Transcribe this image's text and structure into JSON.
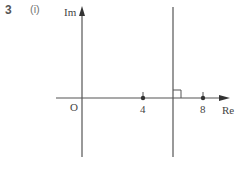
{
  "question": {
    "number": "3",
    "part": "(i)"
  },
  "diagram": {
    "axes": {
      "imaginary_label": "Im",
      "real_label": "Re",
      "origin_label": "O"
    },
    "points": [
      {
        "label": "4",
        "value": 4
      },
      {
        "label": "8",
        "value": 8
      }
    ],
    "perpendicular_line": {
      "description": "vertical line Re(z)=6, perpendicular bisector of 4 and 8",
      "right_angle_marker": true
    },
    "colors": {
      "line": "#444444",
      "text": "#444444"
    }
  }
}
